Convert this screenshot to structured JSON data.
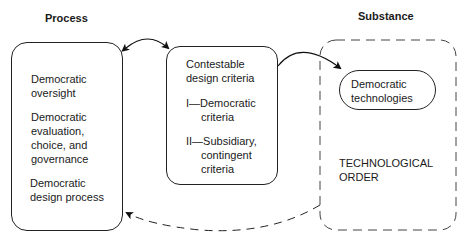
{
  "headings": {
    "process": "Process",
    "substance": "Substance"
  },
  "process_box": {
    "items": [
      "Democratic oversight",
      "Democratic evaluation, choice, and governance",
      "Democratic design process"
    ],
    "lines": [
      [
        "Democratic",
        "oversight"
      ],
      [
        "Democratic",
        "evaluation,",
        "choice, and",
        "governance"
      ],
      [
        "Democratic",
        "design process"
      ]
    ]
  },
  "criteria_box": {
    "title_lines": [
      "Contestable",
      "design criteria"
    ],
    "item1_lines": [
      "I—Democratic",
      "criteria"
    ],
    "item2_lines": [
      "II—Subsidiary,",
      "contingent",
      "criteria"
    ]
  },
  "technologies_box": {
    "lines": [
      "Democratic",
      "technologies"
    ]
  },
  "technological_order": {
    "lines": [
      "TECHNOLOGICAL",
      "ORDER"
    ]
  },
  "connectors": [
    {
      "from": "process_box",
      "to": "criteria_box",
      "style": "solid",
      "direction": "bidirectional"
    },
    {
      "from": "criteria_box",
      "to": "technologies_box",
      "style": "solid",
      "direction": "forward"
    },
    {
      "from": "technological_order",
      "to": "process_box",
      "style": "dashed",
      "direction": "forward"
    }
  ]
}
